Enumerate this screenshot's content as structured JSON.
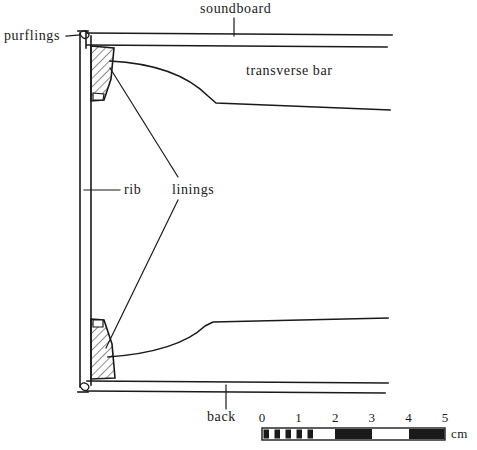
{
  "figure": {
    "type": "technical-cross-section-diagram",
    "background_color": "#ffffff",
    "line_color": "#1a1a1a"
  },
  "labels": {
    "soundboard": "soundboard",
    "purflings": "purflings",
    "transverse_bar": "transverse bar",
    "rib": "rib",
    "linings": "linings",
    "back": "back",
    "unit": "cm"
  },
  "scale_bar": {
    "unit": "cm",
    "ticks": [
      "0",
      "1",
      "2",
      "3",
      "4",
      "5"
    ],
    "min": 0,
    "max": 5,
    "x_start_px": 262,
    "x_end_px": 445,
    "segments": [
      {
        "from": 0,
        "to": 1,
        "style": "mm-striped"
      },
      {
        "from": 1,
        "to": 2,
        "style": "white"
      },
      {
        "from": 2,
        "to": 3,
        "style": "black"
      },
      {
        "from": 3,
        "to": 4,
        "style": "white"
      },
      {
        "from": 4,
        "to": 5,
        "style": "black"
      }
    ],
    "mm_stripe_count": 5
  },
  "parts": [
    {
      "name": "soundboard",
      "description": "upper horizontal plate, two parallel lines"
    },
    {
      "name": "back",
      "description": "lower horizontal plate, two parallel lines"
    },
    {
      "name": "rib",
      "description": "vertical side wall, two parallel lines at left"
    },
    {
      "name": "purflings",
      "description": "small inlay detail at left corners"
    },
    {
      "name": "linings",
      "description": "hatched trapezoidal blocks at inner corners"
    },
    {
      "name": "transverse bar",
      "description": "curved internal brace, upper and lower"
    }
  ]
}
